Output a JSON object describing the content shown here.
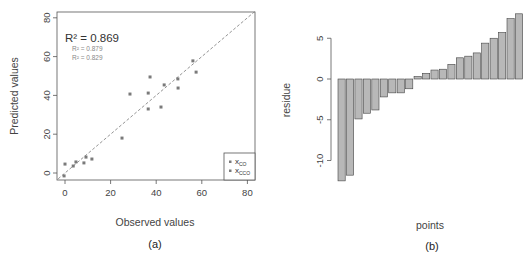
{
  "panels": [
    {
      "id": "a",
      "caption": "(a)",
      "xlabel": "Observed values",
      "ylabel": "Predicted values"
    },
    {
      "id": "b",
      "caption": "(b)",
      "xlabel": "points",
      "ylabel": "residue"
    }
  ],
  "annotations": {
    "r2_main": "R² = 0.869",
    "r2_sub1": "R² = 0.879",
    "r2_sub2": "R² = 0.829"
  },
  "legend": {
    "items": [
      {
        "label": "x",
        "sub": "CO",
        "color": "#7a7a7a"
      },
      {
        "label": "x",
        "sub": "CCO",
        "color": "#7a7a7a"
      }
    ]
  },
  "colors": {
    "points": "#7a7a7a",
    "bars_fill": "#b8b8b8",
    "bars_stroke": "#444444",
    "axis": "#555555",
    "reference_line": "#888888"
  },
  "chart_data": [
    {
      "type": "scatter",
      "title": "",
      "xlabel": "Observed values",
      "ylabel": "Predicted values",
      "xlim": [
        -3,
        83
      ],
      "ylim": [
        -3,
        83
      ],
      "xticks": [
        0,
        20,
        40,
        60,
        80
      ],
      "yticks": [
        0,
        20,
        40,
        60,
        80
      ],
      "grid": false,
      "legend_position": "bottom-right",
      "legend": [
        "x_CO",
        "x_CCO"
      ],
      "reference_line": {
        "type": "y=x",
        "style": "dashed"
      },
      "annotations": [
        "R² = 0.869",
        "R² = 0.879",
        "R² = 0.829"
      ],
      "points": [
        {
          "x": -0.4,
          "y": -1.5
        },
        {
          "x": 0.0,
          "y": 4.6
        },
        {
          "x": 3.6,
          "y": 3.6
        },
        {
          "x": 4.8,
          "y": 5.7
        },
        {
          "x": 8.3,
          "y": 5.2
        },
        {
          "x": 9.2,
          "y": 8.2
        },
        {
          "x": 11.8,
          "y": 7.2
        },
        {
          "x": 25.0,
          "y": 18.0
        },
        {
          "x": 28.5,
          "y": 40.7
        },
        {
          "x": 36.5,
          "y": 41.2
        },
        {
          "x": 36.5,
          "y": 33.0
        },
        {
          "x": 37.3,
          "y": 49.5
        },
        {
          "x": 42.1,
          "y": 34.0
        },
        {
          "x": 43.5,
          "y": 45.4
        },
        {
          "x": 49.5,
          "y": 48.5
        },
        {
          "x": 49.6,
          "y": 43.8
        },
        {
          "x": 56.1,
          "y": 57.8
        },
        {
          "x": 57.5,
          "y": 52.0
        }
      ]
    },
    {
      "type": "bar",
      "title": "",
      "xlabel": "points",
      "ylabel": "residue",
      "ylim": [
        -13,
        8.5
      ],
      "yticks": [
        -10,
        -5,
        0,
        5
      ],
      "grid": false,
      "categories": [
        "1",
        "2",
        "3",
        "4",
        "5",
        "6",
        "7",
        "8",
        "9",
        "10",
        "11",
        "12",
        "13",
        "14",
        "15",
        "16",
        "17",
        "18",
        "19",
        "20",
        "21",
        "22",
        "23",
        "24"
      ],
      "values": [
        -12.5,
        -11.8,
        -4.9,
        -4.2,
        -3.8,
        -2.2,
        -1.7,
        -1.7,
        -1.2,
        0.3,
        0.7,
        1.1,
        1.2,
        1.8,
        2.6,
        2.8,
        3.2,
        4.4,
        5.0,
        5.7,
        7.4,
        8.0
      ]
    }
  ]
}
